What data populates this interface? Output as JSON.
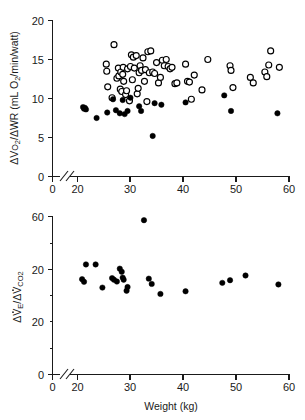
{
  "figure": {
    "x_axis_label": "Weight (kg)",
    "x_ticks": [
      0,
      20,
      30,
      40,
      50,
      60
    ],
    "x_range": [
      14.5,
      60
    ],
    "axis_break": true,
    "marker_colors": {
      "open": "#ffffff",
      "closed": "#000000",
      "stroke": "#000000"
    }
  },
  "chart_data": [
    {
      "type": "scatter",
      "panel": "top",
      "title": "",
      "xlabel": "Weight (kg)",
      "ylabel": "ΔVo₂/ΔWR (mL O₂/min/watt)",
      "ylabel_parts": {
        "delta1": "Δ",
        "v": "V",
        "o_sub": "O",
        "sub2a": "2",
        "slash": "/",
        "delta2": "Δ",
        "wr": "WR",
        "paren_open": " (mL O",
        "sub2b": "2",
        "paren_rest": "/min/watt)"
      },
      "xlim": [
        14.5,
        60
      ],
      "ylim": [
        0,
        20
      ],
      "y_ticks": [
        0,
        5,
        10,
        15,
        20
      ],
      "y_tick_labels": [
        "0",
        "5",
        "10",
        "15",
        "20"
      ],
      "x_ticks": [
        0,
        20,
        30,
        40,
        50,
        60
      ],
      "x_tick_labels": [
        "0",
        "20",
        "30",
        "40",
        "50",
        "60"
      ],
      "grid": false,
      "legend": false,
      "series": [
        {
          "name": "open-circles",
          "marker": "open-circle",
          "points": [
            [
              22.0,
              14.4
            ],
            [
              22.1,
              13.5
            ],
            [
              22.3,
              11.5
            ],
            [
              23.2,
              10.1
            ],
            [
              23.6,
              16.9
            ],
            [
              24.2,
              12.6
            ],
            [
              24.5,
              13.9
            ],
            [
              24.6,
              12.9
            ],
            [
              24.9,
              11.2
            ],
            [
              25.0,
              13.4
            ],
            [
              25.2,
              10.9
            ],
            [
              25.4,
              13.1
            ],
            [
              25.5,
              14.0
            ],
            [
              25.6,
              12.2
            ],
            [
              26.0,
              10.5
            ],
            [
              26.2,
              11.0
            ],
            [
              26.4,
              13.8
            ],
            [
              26.8,
              9.7
            ],
            [
              27.0,
              14.1
            ],
            [
              27.2,
              15.6
            ],
            [
              27.4,
              12.4
            ],
            [
              27.6,
              15.3
            ],
            [
              27.8,
              13.9
            ],
            [
              28.2,
              15.5
            ],
            [
              28.4,
              10.6
            ],
            [
              28.6,
              11.3
            ],
            [
              28.8,
              13.3
            ],
            [
              29.0,
              14.2
            ],
            [
              29.3,
              13.6
            ],
            [
              29.6,
              15.2
            ],
            [
              29.9,
              12.2
            ],
            [
              30.1,
              13.7
            ],
            [
              30.4,
              9.6
            ],
            [
              30.6,
              16.0
            ],
            [
              30.9,
              13.3
            ],
            [
              31.2,
              16.1
            ],
            [
              31.6,
              13.4
            ],
            [
              32.0,
              13.2
            ],
            [
              32.4,
              14.6
            ],
            [
              32.8,
              12.0
            ],
            [
              33.2,
              12.7
            ],
            [
              33.6,
              14.9
            ],
            [
              34.0,
              14.2
            ],
            [
              34.4,
              15.0
            ],
            [
              34.8,
              14.1
            ],
            [
              35.2,
              13.8
            ],
            [
              35.6,
              14.0
            ],
            [
              36.2,
              11.9
            ],
            [
              36.6,
              12.0
            ],
            [
              38.4,
              14.4
            ],
            [
              38.8,
              12.2
            ],
            [
              39.2,
              12.1
            ],
            [
              39.6,
              9.9
            ],
            [
              40.2,
              13.0
            ],
            [
              41.8,
              11.1
            ],
            [
              43.0,
              15.0
            ],
            [
              47.6,
              14.2
            ],
            [
              47.8,
              13.6
            ],
            [
              48.2,
              11.4
            ],
            [
              51.8,
              12.7
            ],
            [
              52.4,
              12.0
            ],
            [
              54.8,
              13.4
            ],
            [
              55.2,
              12.8
            ],
            [
              55.6,
              14.3
            ],
            [
              56.0,
              16.1
            ],
            [
              57.8,
              14.0
            ]
          ]
        },
        {
          "name": "closed-circles",
          "marker": "closed-circle",
          "points": [
            [
              17.2,
              8.9
            ],
            [
              17.4,
              8.7
            ],
            [
              17.6,
              8.8
            ],
            [
              17.8,
              8.6
            ],
            [
              20.0,
              7.5
            ],
            [
              22.2,
              8.2
            ],
            [
              23.4,
              9.9
            ],
            [
              24.0,
              8.5
            ],
            [
              24.8,
              8.1
            ],
            [
              25.4,
              9.8
            ],
            [
              25.8,
              8.0
            ],
            [
              26.4,
              8.4
            ],
            [
              27.0,
              10.1
            ],
            [
              28.8,
              9.0
            ],
            [
              29.2,
              8.4
            ],
            [
              31.6,
              5.2
            ],
            [
              32.0,
              9.4
            ],
            [
              33.4,
              9.2
            ],
            [
              38.4,
              9.5
            ],
            [
              46.4,
              10.4
            ],
            [
              47.8,
              8.4
            ],
            [
              57.4,
              8.1
            ]
          ]
        }
      ]
    },
    {
      "type": "scatter",
      "panel": "bottom",
      "title": "",
      "xlabel": "Weight (kg)",
      "ylabel": "ΔV̇E/ΔV̇CO₂",
      "ylabel_parts": {
        "delta1": "Δ",
        "v1": "V",
        "sub_e": "E",
        "slash": "/",
        "delta2": "Δ",
        "v2": "V",
        "sub_co": "CO",
        "sub2": "2"
      },
      "xlim": [
        14.5,
        60
      ],
      "ylim": [
        0,
        60
      ],
      "y_ticks": [
        0,
        20,
        40,
        60
      ],
      "y_minor_ticks": [
        10,
        30,
        50
      ],
      "y_tick_labels": [
        "0",
        "20",
        "40",
        "60"
      ],
      "x_ticks": [
        0,
        20,
        30,
        40,
        50,
        60
      ],
      "x_tick_labels": [
        "0",
        "20",
        "30",
        "40",
        "50",
        "60"
      ],
      "grid": false,
      "legend": false,
      "series": [
        {
          "name": "closed-circles",
          "marker": "closed-circle",
          "points": [
            [
              17.0,
              36.2
            ],
            [
              17.4,
              35.2
            ],
            [
              17.8,
              41.8
            ],
            [
              19.8,
              41.8
            ],
            [
              21.2,
              33.0
            ],
            [
              23.2,
              36.6
            ],
            [
              23.6,
              36.0
            ],
            [
              24.2,
              35.3
            ],
            [
              24.8,
              40.2
            ],
            [
              25.2,
              39.0
            ],
            [
              25.4,
              36.8
            ],
            [
              25.6,
              36.0
            ],
            [
              26.2,
              31.8
            ],
            [
              26.4,
              33.2
            ],
            [
              29.8,
              58.6
            ],
            [
              30.8,
              36.4
            ],
            [
              31.4,
              34.4
            ],
            [
              33.2,
              30.6
            ],
            [
              38.4,
              31.6
            ],
            [
              46.0,
              34.8
            ],
            [
              47.6,
              35.8
            ],
            [
              50.8,
              37.6
            ],
            [
              57.6,
              34.2
            ]
          ]
        }
      ]
    }
  ]
}
